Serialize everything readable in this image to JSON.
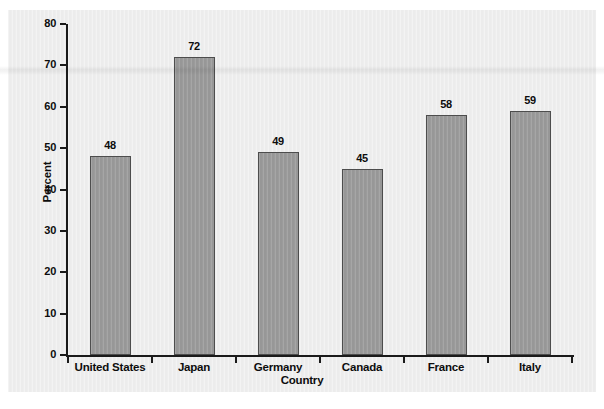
{
  "chart_data": {
    "type": "bar",
    "title": "",
    "subtitle": "",
    "xlabel": "Country",
    "ylabel": "Percent",
    "categories": [
      "United States",
      "Japan",
      "Germany",
      "Canada",
      "France",
      "Italy"
    ],
    "values": [
      48,
      72,
      49,
      45,
      58,
      59
    ],
    "value_labels": [
      "48",
      "72",
      "49",
      "45",
      "58",
      "59"
    ],
    "ylim": [
      0,
      80
    ],
    "ytick_values": [
      0,
      10,
      20,
      30,
      40,
      50,
      60,
      70,
      80
    ],
    "ytick_labels": [
      "0",
      "10",
      "20",
      "30",
      "40",
      "50",
      "60",
      "70",
      "80"
    ],
    "grid": false,
    "legend": null,
    "legend_position": "none",
    "bar_color": "#9b9b9b",
    "bar_edge_color": "#4d4d4d",
    "panel_color": "#eeeeee",
    "axis_color": "#1a1a1a",
    "text_color": "#0d0d0d",
    "annotations": []
  }
}
